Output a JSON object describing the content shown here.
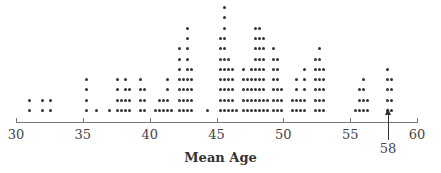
{
  "chart_data": {
    "type": "dot",
    "title": "",
    "xlabel": "Mean Age",
    "ylabel": "",
    "xlim": [
      30,
      60
    ],
    "xticks": [
      30,
      35,
      40,
      45,
      50,
      55,
      60
    ],
    "annotation": {
      "label": "58",
      "x": 58,
      "type": "arrow"
    },
    "columns": [
      {
        "x": 31.0,
        "count": 2
      },
      {
        "x": 32.0,
        "count": 2
      },
      {
        "x": 32.6,
        "count": 2
      },
      {
        "x": 35.3,
        "count": 4
      },
      {
        "x": 36.0,
        "count": 1
      },
      {
        "x": 37.0,
        "count": 1
      },
      {
        "x": 37.6,
        "count": 4
      },
      {
        "x": 37.9,
        "count": 2
      },
      {
        "x": 38.2,
        "count": 4
      },
      {
        "x": 38.5,
        "count": 3
      },
      {
        "x": 39.3,
        "count": 4
      },
      {
        "x": 39.6,
        "count": 3
      },
      {
        "x": 40.4,
        "count": 1
      },
      {
        "x": 40.7,
        "count": 2
      },
      {
        "x": 41.0,
        "count": 2
      },
      {
        "x": 41.3,
        "count": 4
      },
      {
        "x": 41.6,
        "count": 1
      },
      {
        "x": 42.2,
        "count": 7
      },
      {
        "x": 42.5,
        "count": 4
      },
      {
        "x": 42.8,
        "count": 9
      },
      {
        "x": 43.1,
        "count": 5
      },
      {
        "x": 44.3,
        "count": 1
      },
      {
        "x": 45.3,
        "count": 8
      },
      {
        "x": 45.6,
        "count": 11
      },
      {
        "x": 45.9,
        "count": 6
      },
      {
        "x": 46.2,
        "count": 5
      },
      {
        "x": 46.5,
        "count": 1
      },
      {
        "x": 47.0,
        "count": 5
      },
      {
        "x": 47.3,
        "count": 4
      },
      {
        "x": 47.6,
        "count": 5
      },
      {
        "x": 47.9,
        "count": 9
      },
      {
        "x": 48.2,
        "count": 9
      },
      {
        "x": 48.5,
        "count": 8
      },
      {
        "x": 48.8,
        "count": 2
      },
      {
        "x": 49.3,
        "count": 7
      },
      {
        "x": 49.6,
        "count": 6
      },
      {
        "x": 49.9,
        "count": 3
      },
      {
        "x": 50.7,
        "count": 2
      },
      {
        "x": 51.0,
        "count": 4
      },
      {
        "x": 51.3,
        "count": 2
      },
      {
        "x": 51.6,
        "count": 5
      },
      {
        "x": 52.4,
        "count": 6
      },
      {
        "x": 52.7,
        "count": 7
      },
      {
        "x": 53.0,
        "count": 5
      },
      {
        "x": 55.4,
        "count": 1
      },
      {
        "x": 55.7,
        "count": 3
      },
      {
        "x": 56.0,
        "count": 4
      },
      {
        "x": 56.3,
        "count": 2
      },
      {
        "x": 57.8,
        "count": 5
      },
      {
        "x": 58.1,
        "count": 4
      }
    ]
  }
}
